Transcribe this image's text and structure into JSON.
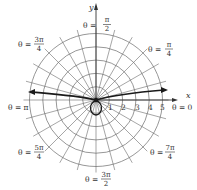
{
  "diagram": {
    "title": "",
    "type": "polar-grid",
    "axes": {
      "x_label": "x",
      "y_label": "y"
    },
    "radial_ticks": [
      "1",
      "2",
      "3",
      "4",
      "5"
    ],
    "angle_labels": {
      "theta_0": {
        "prefix": "θ = ",
        "num": "0",
        "den": ""
      },
      "theta_pi_4": {
        "prefix": "θ = ",
        "num": "π",
        "den": "4"
      },
      "theta_pi_2": {
        "prefix": "θ = ",
        "num": "π",
        "den": "2"
      },
      "theta_3pi_4": {
        "prefix": "θ = ",
        "num": "3π",
        "den": "4"
      },
      "theta_pi": {
        "prefix": "θ = ",
        "num": "π",
        "den": ""
      },
      "theta_5pi_4": {
        "prefix": "θ = ",
        "num": "5π",
        "den": "4"
      },
      "theta_3pi_2": {
        "prefix": "θ = ",
        "num": "3π",
        "den": "2"
      },
      "theta_7pi_4": {
        "prefix": "θ = ",
        "num": "7π",
        "den": "4"
      }
    },
    "grid": {
      "circles": 5,
      "rays_every_degrees": 15
    },
    "colors": {
      "grid": "#6a6a6a",
      "curve": "#1a1a1a",
      "text": "#333333"
    }
  }
}
